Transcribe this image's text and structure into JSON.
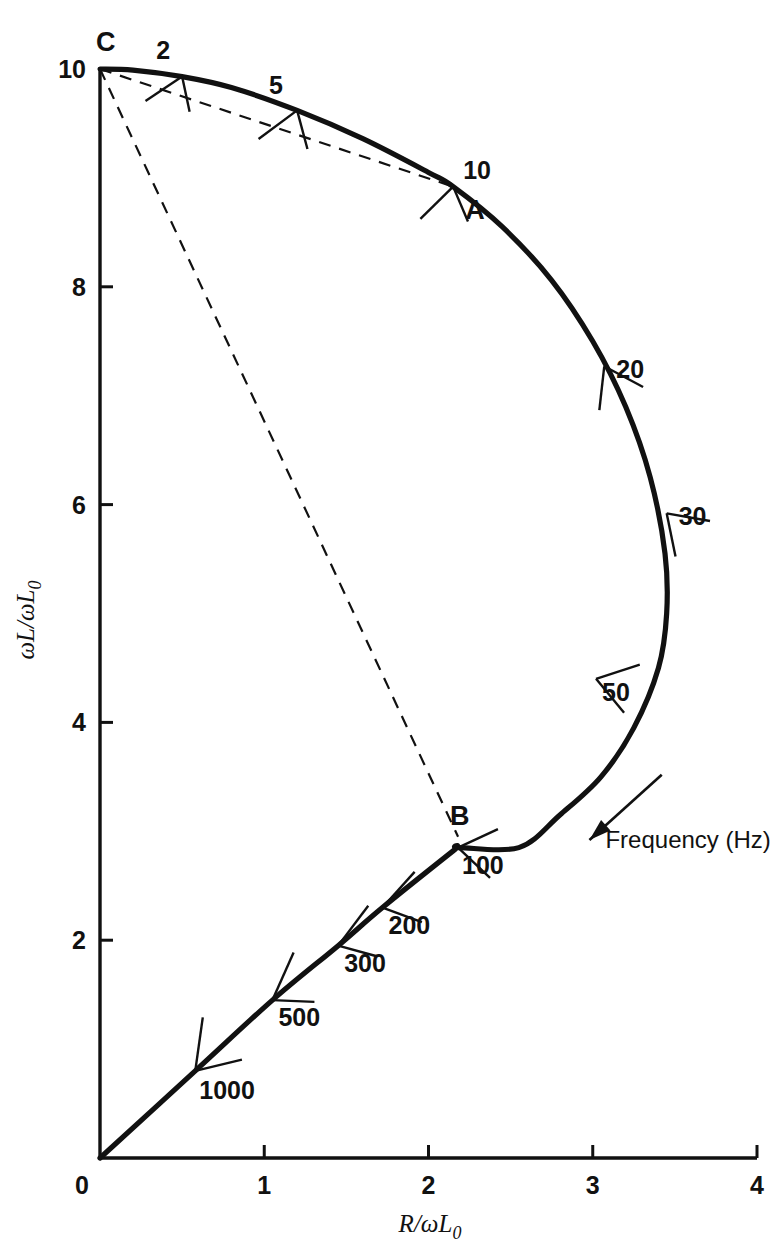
{
  "figure": {
    "title": "",
    "background_color": "#ffffff",
    "line_color": "#111111"
  },
  "axes": {
    "x_label": "R/ωL",
    "x_label_sub": "0",
    "y_label": "ωL/ωL",
    "y_label_sub": "0",
    "x_ticks": [
      "0",
      "1",
      "2",
      "3",
      "4"
    ],
    "y_ticks": [
      "0",
      "2",
      "4",
      "6",
      "8",
      "10"
    ]
  },
  "annotations": {
    "frequency_arrow_label": "Frequency (Hz)",
    "point_a": "A",
    "point_b": "B",
    "point_c": "C"
  },
  "chart_data": {
    "type": "line",
    "title": "",
    "xlabel": "R/ωL₀",
    "ylabel": "ωL/ωL₀",
    "xlim": [
      0,
      4
    ],
    "ylim": [
      0,
      10
    ],
    "x_ticks": [
      0,
      1,
      2,
      3,
      4
    ],
    "y_ticks": [
      0,
      2,
      4,
      6,
      8,
      10
    ],
    "grid": false,
    "legend": false,
    "series": [
      {
        "name": "impedance locus",
        "style": "solid-thick",
        "points": [
          [
            0.0,
            10.0
          ],
          [
            0.2,
            9.99
          ],
          [
            0.5,
            9.93
          ],
          [
            0.8,
            9.83
          ],
          [
            1.2,
            9.62
          ],
          [
            1.6,
            9.36
          ],
          [
            2.0,
            9.05
          ],
          [
            2.15,
            8.92
          ],
          [
            2.45,
            8.55
          ],
          [
            2.75,
            8.06
          ],
          [
            3.0,
            7.5
          ],
          [
            3.2,
            6.9
          ],
          [
            3.35,
            6.25
          ],
          [
            3.44,
            5.55
          ],
          [
            3.45,
            5.0
          ],
          [
            3.4,
            4.5
          ],
          [
            3.25,
            3.95
          ],
          [
            3.05,
            3.5
          ],
          [
            2.8,
            3.15
          ],
          [
            2.55,
            2.85
          ],
          [
            2.18,
            2.85
          ],
          [
            2.15,
            2.82
          ],
          [
            1.72,
            2.3
          ],
          [
            1.45,
            1.95
          ],
          [
            1.05,
            1.45
          ],
          [
            0.58,
            0.8
          ],
          [
            0.0,
            0.0
          ]
        ]
      },
      {
        "name": "dashed chord C-A",
        "style": "dashed",
        "points": [
          [
            0.0,
            10.0
          ],
          [
            2.15,
            8.92
          ]
        ]
      },
      {
        "name": "dashed chord C-B",
        "style": "dashed",
        "points": [
          [
            0.0,
            10.0
          ],
          [
            2.18,
            2.95
          ]
        ]
      }
    ],
    "frequency_markers": [
      {
        "label": "2",
        "x": 0.5,
        "y": 9.93,
        "label_dx": -26,
        "label_dy": -18,
        "tick_angle_deg": 102,
        "tick_len": [
          36,
          44
        ]
      },
      {
        "label": "5",
        "x": 1.2,
        "y": 9.62,
        "label_dx": -28,
        "label_dy": -16,
        "tick_angle_deg": 105,
        "tick_len": [
          40,
          48
        ]
      },
      {
        "label": "10",
        "x": 2.15,
        "y": 8.92,
        "label_dx": 10,
        "label_dy": -8,
        "tick_angle_deg": 113,
        "tick_len": [
          38,
          46
        ]
      },
      {
        "label": "20",
        "x": 3.07,
        "y": 7.27,
        "label_dx": 12,
        "label_dy": 12,
        "tick_angle_deg": 152,
        "tick_len": [
          44,
          44
        ]
      },
      {
        "label": "30",
        "x": 3.45,
        "y": 5.92,
        "label_dx": 12,
        "label_dy": 12,
        "tick_angle_deg": 170,
        "tick_len": [
          44,
          44
        ]
      },
      {
        "label": "50",
        "x": 3.02,
        "y": 4.4,
        "label_dx": 6,
        "label_dy": 22,
        "tick_angle_deg": 198,
        "tick_len": [
          46,
          44
        ]
      },
      {
        "label": "100",
        "x": 2.18,
        "y": 2.85,
        "label_dx": 4,
        "label_dy": 26,
        "tick_angle_deg": 205,
        "tick_len": [
          44,
          44
        ]
      },
      {
        "label": "200",
        "x": 1.72,
        "y": 2.3,
        "label_dx": 6,
        "label_dy": 26,
        "tick_angle_deg": 228,
        "tick_len": [
          48,
          42
        ]
      },
      {
        "label": "300",
        "x": 1.45,
        "y": 1.95,
        "label_dx": 6,
        "label_dy": 26,
        "tick_angle_deg": 233,
        "tick_len": [
          50,
          40
        ]
      },
      {
        "label": "500",
        "x": 1.05,
        "y": 1.45,
        "label_dx": 6,
        "label_dy": 26,
        "tick_angle_deg": 246,
        "tick_len": [
          52,
          42
        ]
      },
      {
        "label": "1000",
        "x": 0.58,
        "y": 0.8,
        "label_dx": 4,
        "label_dy": 28,
        "tick_angle_deg": 262,
        "tick_len": [
          54,
          48
        ]
      }
    ],
    "point_markers": [
      {
        "label": "A",
        "x": 2.15,
        "y": 8.92,
        "label_dx": 12,
        "label_dy": 32
      },
      {
        "label": "B",
        "x": 2.18,
        "y": 2.95,
        "label_dx": -8,
        "label_dy": -12
      },
      {
        "label": "C",
        "x": 0.0,
        "y": 10.0,
        "label_dx": -4,
        "label_dy": -18
      }
    ],
    "arrow": {
      "label": "Frequency (Hz)",
      "from_x": 3.42,
      "from_y": 3.52,
      "to_x": 2.98,
      "to_y": 2.92
    }
  }
}
